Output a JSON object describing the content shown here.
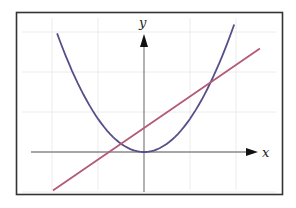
{
  "chart_data": {
    "type": "line",
    "title": "",
    "xlabel": "x",
    "ylabel": "y",
    "grid": true,
    "legend": null,
    "xlim": [
      -2.4,
      2.7
    ],
    "ylim": [
      -1.0,
      3.0
    ],
    "x_ticks": [
      -2,
      -1,
      0,
      1,
      2
    ],
    "y_ticks": [
      -1,
      0,
      1,
      2,
      3
    ],
    "tick_labels_shown": false,
    "series": [
      {
        "name": "parabola",
        "kind": "quadratic",
        "equation": "y = 0.83 x^2",
        "color": "#55508a",
        "x": [
          -1.89,
          -1.5,
          -1.0,
          -0.5,
          0.0,
          0.5,
          1.0,
          1.5,
          1.96
        ],
        "y": [
          2.95,
          1.87,
          0.83,
          0.21,
          0.0,
          0.21,
          0.83,
          1.87,
          2.95
        ]
      },
      {
        "name": "line",
        "kind": "linear",
        "equation": "y = 0.79 x + 0.6",
        "color": "#b45a78",
        "x": [
          -1.98,
          2.52
        ],
        "y": [
          -0.96,
          2.59
        ]
      }
    ],
    "intersections": [
      {
        "x": -0.5,
        "y": 0.2
      },
      {
        "x": 1.52,
        "y": 1.8
      }
    ]
  },
  "labels": {
    "x_axis": "x",
    "y_axis": "y"
  },
  "colors": {
    "frame": "#333333",
    "axis": "#888888",
    "grid": "#ececec",
    "arrow": "#111111"
  }
}
